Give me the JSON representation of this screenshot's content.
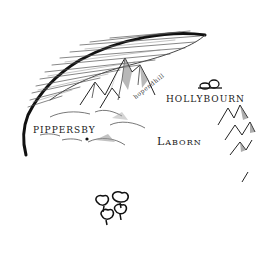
{
  "map": {
    "style": "hand-drawn ink fantasy map",
    "background": "#ffffff",
    "ink_color": "#1a1a1a",
    "labels": {
      "hollybourn": "hollybourn",
      "pippersby": "pippersby",
      "laborn": "Laborn",
      "hopendhill": "hopendhill"
    },
    "features": [
      {
        "type": "forest-edge",
        "name": "northern woods",
        "region": "top-left arc"
      },
      {
        "type": "mountains",
        "name": "central peaks",
        "region": "center-top"
      },
      {
        "type": "mountains",
        "name": "eastern range",
        "region": "right"
      },
      {
        "type": "hills",
        "name": "pippersby hills",
        "region": "left-center"
      },
      {
        "type": "trees",
        "name": "grove",
        "region": "bottom-center"
      },
      {
        "type": "rocks",
        "name": "hollybourn stones",
        "region": "above hollybourn"
      },
      {
        "type": "town-marker",
        "name": "pippersby",
        "region": "left-center"
      }
    ]
  }
}
